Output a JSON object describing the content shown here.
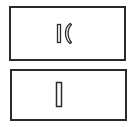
{
  "diagram": {
    "colors": {
      "stroke": "#2a2a2a",
      "background": "#ffffff"
    },
    "panels": [
      {
        "name": "top-panel",
        "elements": [
          "vertical-bar",
          "crescent"
        ]
      },
      {
        "name": "bottom-panel",
        "elements": [
          "vertical-bar"
        ]
      }
    ]
  }
}
